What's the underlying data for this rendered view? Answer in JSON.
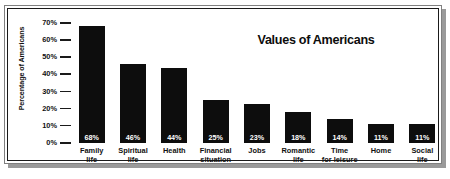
{
  "chart_data": {
    "type": "bar",
    "title": "Values of Americans",
    "xlabel": "",
    "ylabel": "Percentage of Americans",
    "ylim": [
      0,
      70
    ],
    "ytick_labels": [
      "70%",
      "60%",
      "50%",
      "40%",
      "30%",
      "20%",
      "10%",
      "0%"
    ],
    "ytick_values": [
      70,
      60,
      50,
      40,
      30,
      20,
      10,
      0
    ],
    "grid": false,
    "legend": false,
    "bar_color": "#0d0d0d",
    "value_label_color": "#ffffff",
    "categories": [
      "Family life",
      "Spiritual life",
      "Health",
      "Financial situation",
      "Jobs",
      "Romantic life",
      "Time for leisure",
      "Home",
      "Social life"
    ],
    "category_lines": [
      [
        "Family",
        "life"
      ],
      [
        "Spiritual",
        "life"
      ],
      [
        "Health",
        ""
      ],
      [
        "Financial",
        "situation"
      ],
      [
        "Jobs",
        ""
      ],
      [
        "Romantic",
        "life"
      ],
      [
        "Time",
        "for leisure"
      ],
      [
        "Home",
        ""
      ],
      [
        "Social",
        "life"
      ]
    ],
    "values": [
      68,
      46,
      44,
      25,
      23,
      18,
      14,
      11,
      11
    ],
    "value_labels": [
      "68%",
      "46%",
      "44%",
      "25%",
      "23%",
      "18%",
      "14%",
      "11%",
      "11%"
    ]
  }
}
